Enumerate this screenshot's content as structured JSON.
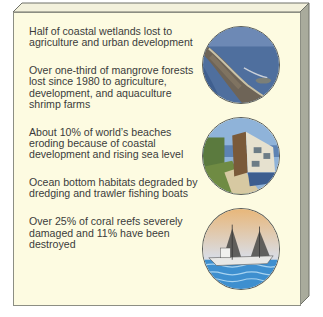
{
  "panel": {
    "colors": {
      "face": "#fdfbe1",
      "top_bevel": "#f3f1dc",
      "side_bevel": "#a9ab9c",
      "edge": "#6f7168",
      "text": "#3b3b3b"
    },
    "items": [
      {
        "text": "Half of coastal wetlands lost to agriculture and urban development"
      },
      {
        "text": "Over one-third of mangrove forests lost since 1980 to agriculture, development, and aquaculture shrimp farms"
      },
      {
        "text": "About 10% of world’s beaches eroding because of coastal development and rising sea level"
      },
      {
        "text": "Ocean bottom habitats degraded by dredging and trawler fishing boats"
      },
      {
        "text": "Over 25% of coral reefs severely damaged and 11% have been destroyed"
      }
    ],
    "images": [
      {
        "subject": "aerial-coastline-photo"
      },
      {
        "subject": "eroding-beach-house-photo"
      },
      {
        "subject": "trawler-fishing-boat-illustration"
      }
    ]
  }
}
